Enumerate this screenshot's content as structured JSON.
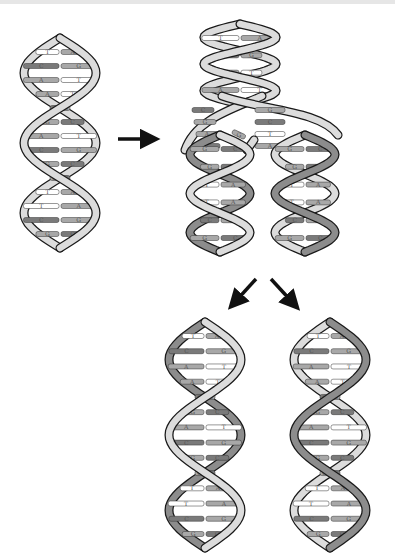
{
  "diagram": {
    "colors": {
      "light_strand": "#dcdcdc",
      "dark_strand": "#8c8c8c",
      "outline": "#1a1a1a",
      "base_dark": "#7a7a7a",
      "base_mid": "#a8a8a8",
      "base_light": "#ffffff",
      "arrow": "#111111"
    },
    "parent_helix": {
      "pairs": [
        [
          "T",
          "A"
        ],
        [
          "C",
          "G"
        ],
        [
          "A",
          "T"
        ],
        [
          "A",
          "T"
        ],
        [
          "C",
          "G"
        ],
        [
          "G",
          "C"
        ],
        [
          "A",
          "T"
        ],
        [
          "C",
          "G"
        ],
        [
          "G",
          "C"
        ],
        [
          "G",
          "C"
        ],
        [
          "T",
          "A"
        ],
        [
          "T",
          "A"
        ],
        [
          "C",
          "G"
        ],
        [
          "G",
          "C"
        ]
      ]
    },
    "replication_fork": {
      "top_pairs": [
        [
          "T",
          "A"
        ],
        [
          "C",
          "G"
        ],
        [
          "A",
          "T"
        ],
        [
          "A",
          "T"
        ]
      ],
      "left_new_strand_bases": [
        "C",
        "G",
        "A",
        "C"
      ],
      "right_new_strand_bases": [
        "G",
        "C",
        "T",
        "A"
      ],
      "free_nucleotide": "G",
      "daughter_left_pairs": [
        [
          "G",
          "C"
        ],
        [
          "G",
          "C"
        ],
        [
          "T",
          "A"
        ],
        [
          "T",
          "A"
        ],
        [
          "C",
          "G"
        ],
        [
          "G",
          "C"
        ]
      ],
      "daughter_right_pairs": [
        [
          "G",
          "C"
        ],
        [
          "G",
          "C"
        ],
        [
          "T",
          "A"
        ],
        [
          "T",
          "A"
        ],
        [
          "C",
          "G"
        ],
        [
          "G",
          "C"
        ]
      ]
    },
    "daughter_left": {
      "label": "daughter DNA 1",
      "pairs": [
        [
          "T",
          "A"
        ],
        [
          "C",
          "G"
        ],
        [
          "A",
          "T"
        ],
        [
          "A",
          "T"
        ],
        [
          "C",
          "G"
        ],
        [
          "G",
          "C"
        ],
        [
          "A",
          "T"
        ],
        [
          "C",
          "G"
        ],
        [
          "G",
          "C"
        ],
        [
          "G",
          "C"
        ],
        [
          "T",
          "A"
        ],
        [
          "T",
          "A"
        ],
        [
          "C",
          "G"
        ],
        [
          "G",
          "C"
        ]
      ]
    },
    "daughter_right": {
      "label": "daughter DNA 2",
      "pairs": [
        [
          "T",
          "A"
        ],
        [
          "C",
          "G"
        ],
        [
          "A",
          "T"
        ],
        [
          "A",
          "T"
        ],
        [
          "C",
          "G"
        ],
        [
          "G",
          "C"
        ],
        [
          "A",
          "T"
        ],
        [
          "C",
          "G"
        ],
        [
          "G",
          "C"
        ],
        [
          "G",
          "C"
        ],
        [
          "T",
          "A"
        ],
        [
          "T",
          "A"
        ],
        [
          "C",
          "G"
        ],
        [
          "G",
          "C"
        ]
      ]
    },
    "arrows": [
      "right-arrow",
      "down-left-arrow",
      "down-right-arrow"
    ]
  }
}
